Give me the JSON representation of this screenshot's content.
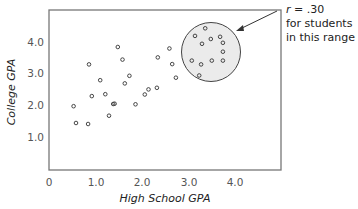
{
  "chart_data": {
    "type": "scatter",
    "title": "",
    "xlabel": "High School GPA",
    "ylabel": "College GPA",
    "xlim": [
      0,
      4.8
    ],
    "ylim": [
      0,
      4.9
    ],
    "x_ticks": [
      "0",
      "1.0",
      "2.0",
      "3.0",
      "4.0"
    ],
    "y_ticks": [
      "1.0",
      "2.0",
      "3.0",
      "4.0"
    ],
    "grid": false,
    "legend": null,
    "series": [
      {
        "name": "all students",
        "points": [
          [
            0.58,
            1.45
          ],
          [
            0.53,
            1.98
          ],
          [
            0.84,
            1.42
          ],
          [
            1.29,
            1.68
          ],
          [
            1.38,
            2.05
          ],
          [
            0.92,
            2.3
          ],
          [
            0.86,
            3.3
          ],
          [
            1.1,
            2.8
          ],
          [
            1.21,
            2.36
          ],
          [
            1.48,
            3.85
          ],
          [
            1.58,
            3.45
          ],
          [
            1.41,
            2.06
          ],
          [
            1.63,
            2.7
          ],
          [
            1.86,
            2.04
          ],
          [
            1.73,
            2.94
          ],
          [
            2.06,
            2.35
          ],
          [
            2.14,
            2.51
          ],
          [
            2.32,
            2.56
          ],
          [
            2.34,
            3.52
          ],
          [
            2.59,
            3.8
          ],
          [
            2.65,
            3.31
          ],
          [
            2.73,
            2.88
          ]
        ]
      },
      {
        "name": "students in this range",
        "points": [
          [
            3.36,
            4.44
          ],
          [
            3.14,
            4.2
          ],
          [
            3.29,
            3.95
          ],
          [
            3.48,
            4.1
          ],
          [
            3.68,
            4.17
          ],
          [
            3.74,
            3.98
          ],
          [
            3.74,
            3.7
          ],
          [
            3.07,
            3.42
          ],
          [
            3.27,
            3.3
          ],
          [
            3.5,
            3.42
          ],
          [
            3.74,
            3.42
          ],
          [
            3.23,
            2.95
          ]
        ],
        "highlight_circle": {
          "cx": 3.49,
          "cy": 3.69,
          "r_px": 29.5,
          "fill": "#ebebeb"
        }
      }
    ],
    "annotations": [
      {
        "text_lines": [
          "r = .30",
          "for students",
          "in this range"
        ],
        "arrow_to": "highlight_circle"
      }
    ]
  },
  "annotation": {
    "r_symbol": "r",
    "r_value": " = .30",
    "line2": "for students",
    "line3": "in this range"
  },
  "axes": {
    "xlabel": "High School GPA",
    "ylabel": "College GPA",
    "x_ticks": [
      "0",
      "1.0",
      "2.0",
      "3.0",
      "4.0"
    ],
    "y_ticks": [
      "1.0",
      "2.0",
      "3.0",
      "4.0"
    ]
  },
  "colors": {
    "frame": "#777777",
    "point": "#333333",
    "circle_fill": "#ebebeb",
    "circle_stroke": "#444444"
  }
}
